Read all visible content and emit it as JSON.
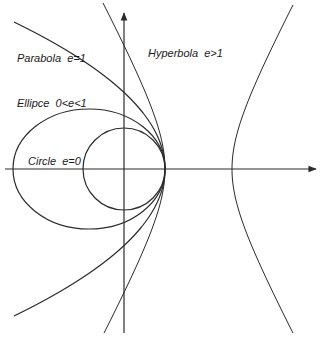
{
  "diagram": {
    "colors": {
      "stroke": "#2b2b2b",
      "text": "#1a1a1a",
      "background": "#ffffff"
    },
    "axes": {
      "x": {
        "x1": 5,
        "y": 169,
        "x2": 316
      },
      "y": {
        "x": 124,
        "y1": 333,
        "y2": 13
      }
    },
    "focus_vertex": {
      "x": 165,
      "y": 169
    },
    "labels": {
      "parabola": "Parabola  e=1",
      "ellipse": "Ellipce  0<e<1",
      "circle": "Circle  e=0",
      "hyperbola": "Hyperbola  e>1"
    },
    "curves": [
      {
        "name": "circle",
        "eccentricity": "e=0",
        "cx": 124,
        "cy": 169,
        "r": 41
      },
      {
        "name": "ellipse",
        "eccentricity": "0<e<1",
        "cx": 89,
        "cy": 169,
        "rx": 76,
        "ry": 60
      },
      {
        "name": "parabola",
        "eccentricity": "e=1",
        "vertex_x": 165,
        "vertex_y": 169,
        "k": 0.00699,
        "y_extent": 147
      },
      {
        "name": "hyperbola",
        "eccentricity": "e>1",
        "center_x": 198.5,
        "center_y": 169,
        "a": 33.5,
        "b": 62.2
      }
    ]
  }
}
